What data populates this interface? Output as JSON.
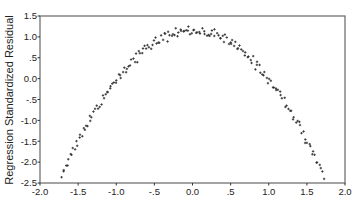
{
  "chart_data": {
    "type": "scatter",
    "title": "",
    "xlabel": "",
    "ylabel": "Regression Standardized Residual",
    "xlim": [
      -2.0,
      2.0
    ],
    "ylim": [
      -2.5,
      1.5
    ],
    "x_ticks": [
      -2.0,
      -1.5,
      -1.0,
      -0.5,
      0.0,
      0.5,
      1.0,
      1.5,
      2.0
    ],
    "x_tick_labels": [
      "-2.0",
      "-1.5",
      "-1.0",
      "-.5",
      "0.0",
      ".5",
      "1.0",
      "1.5",
      "2.0"
    ],
    "y_ticks": [
      1.5,
      1.0,
      0.5,
      0.0,
      -0.5,
      -1.0,
      -1.5,
      -2.0,
      -2.5
    ],
    "y_tick_labels": [
      "1.5",
      "1.0",
      ".5",
      "0.0",
      "-.5",
      "-1.0",
      "-1.5",
      "-2.0",
      "-2.5"
    ],
    "grid": false,
    "legend": null,
    "marker": "small cross/triangle, dark gray",
    "pattern": "inverted parabola (quadratic) — residuals vs. predicted",
    "approx_model": {
      "a": -1.17,
      "b": 0.0,
      "c": 1.15,
      "noise_sd": 0.06,
      "x_min": -1.72,
      "x_max": 1.72,
      "n_points": 180
    },
    "key_points": [
      {
        "x": -1.7,
        "y": -2.2
      },
      {
        "x": -1.5,
        "y": -1.5
      },
      {
        "x": -1.0,
        "y": -0.05
      },
      {
        "x": -0.5,
        "y": 0.85
      },
      {
        "x": 0.0,
        "y": 1.15
      },
      {
        "x": 0.5,
        "y": 0.85
      },
      {
        "x": 1.0,
        "y": 0.0
      },
      {
        "x": 1.5,
        "y": -1.45
      },
      {
        "x": 1.7,
        "y": -2.15
      }
    ]
  },
  "colors": {
    "background": "#ffffff",
    "frame": "#666666",
    "marker": "#333333",
    "text": "#222222"
  }
}
